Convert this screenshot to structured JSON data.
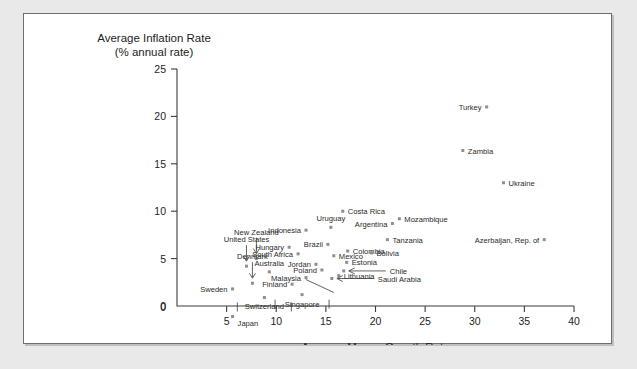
{
  "chart_data": {
    "type": "scatter",
    "title": "",
    "ylabel": "Average Inflation Rate",
    "ylabel_sub": "(% annual rate)",
    "xlabel": "Average Money Growth Rate",
    "xlabel_sub": "(% annual rate)",
    "xlim": [
      0,
      40
    ],
    "ylim": [
      0,
      25
    ],
    "xticks": [
      0,
      5,
      10,
      15,
      20,
      25,
      30,
      35,
      40
    ],
    "yticks": [
      0,
      5,
      10,
      15,
      20,
      25
    ],
    "xtick_labels": [
      "0",
      "5",
      "10",
      "15",
      "20",
      "25",
      "30",
      "35",
      "40"
    ],
    "ytick_labels": [
      "0",
      "5",
      "10",
      "15",
      "20",
      "25"
    ],
    "grid": false,
    "legend": "none",
    "marker_color": "#8e8e93",
    "points": [
      {
        "name": "Turkey",
        "x": 31.2,
        "y": 21.0,
        "label_side": "left"
      },
      {
        "name": "Zambia",
        "x": 28.8,
        "y": 16.4,
        "label_side": "right"
      },
      {
        "name": "Ukraine",
        "x": 32.9,
        "y": 13.0,
        "label_side": "right"
      },
      {
        "name": "Costa Rica",
        "x": 16.7,
        "y": 10.0,
        "label_side": "right"
      },
      {
        "name": "Mozambique",
        "x": 22.4,
        "y": 9.2,
        "label_side": "right"
      },
      {
        "name": "Argentina",
        "x": 21.7,
        "y": 8.7,
        "label_side": "left"
      },
      {
        "name": "Uruguay",
        "x": 15.5,
        "y": 8.3,
        "label_side": "above"
      },
      {
        "name": "Indonesia",
        "x": 13.0,
        "y": 8.0,
        "label_side": "left"
      },
      {
        "name": "Tanzania",
        "x": 21.2,
        "y": 7.0,
        "label_side": "right"
      },
      {
        "name": "Azerbaijan, Rep. of",
        "x": 37.0,
        "y": 7.0,
        "label_side": "left"
      },
      {
        "name": "Brazil",
        "x": 15.2,
        "y": 6.5,
        "label_side": "left"
      },
      {
        "name": "Hungary",
        "x": 11.3,
        "y": 6.2,
        "label_side": "left"
      },
      {
        "name": "Colombia",
        "x": 17.2,
        "y": 5.8,
        "label_side": "right"
      },
      {
        "name": "Bolivia",
        "x": 19.6,
        "y": 5.6,
        "label_side": "right"
      },
      {
        "name": "South Africa",
        "x": 12.2,
        "y": 5.5,
        "label_side": "left"
      },
      {
        "name": "Mexico",
        "x": 15.8,
        "y": 5.3,
        "label_side": "right"
      },
      {
        "name": "New Zealand",
        "x": 8.0,
        "y": 5.0,
        "label_side": "leader-up"
      },
      {
        "name": "Estonia",
        "x": 17.1,
        "y": 4.6,
        "label_side": "right"
      },
      {
        "name": "Jordan",
        "x": 14.0,
        "y": 4.4,
        "label_side": "left"
      },
      {
        "name": "United States",
        "x": 7.0,
        "y": 4.2,
        "label_side": "leader-up"
      },
      {
        "name": "Poland",
        "x": 14.6,
        "y": 3.8,
        "label_side": "left"
      },
      {
        "name": "Australia",
        "x": 9.3,
        "y": 3.6,
        "label_side": "above"
      },
      {
        "name": "Chile",
        "x": 16.8,
        "y": 3.7,
        "label_side": "leader-right"
      },
      {
        "name": "Lithuania",
        "x": 16.3,
        "y": 3.2,
        "label_side": "right"
      },
      {
        "name": "Malaysia",
        "x": 13.0,
        "y": 3.0,
        "label_side": "left"
      },
      {
        "name": "Saudi Arabia",
        "x": 15.6,
        "y": 2.9,
        "label_side": "leader-right"
      },
      {
        "name": "Denmark",
        "x": 7.6,
        "y": 2.4,
        "label_side": "leader-up"
      },
      {
        "name": "Finland",
        "x": 11.6,
        "y": 2.3,
        "label_side": "left"
      },
      {
        "name": "Sweden",
        "x": 5.6,
        "y": 1.8,
        "label_side": "left"
      },
      {
        "name": "Switzerland",
        "x": 8.8,
        "y": 0.9,
        "label_side": "leader-bars"
      },
      {
        "name": "Singapore",
        "x": 12.6,
        "y": 1.2,
        "label_side": "leader-bars"
      },
      {
        "name": "Japan",
        "x": 5.6,
        "y": -1.2,
        "label_side": "below-axis"
      }
    ]
  }
}
